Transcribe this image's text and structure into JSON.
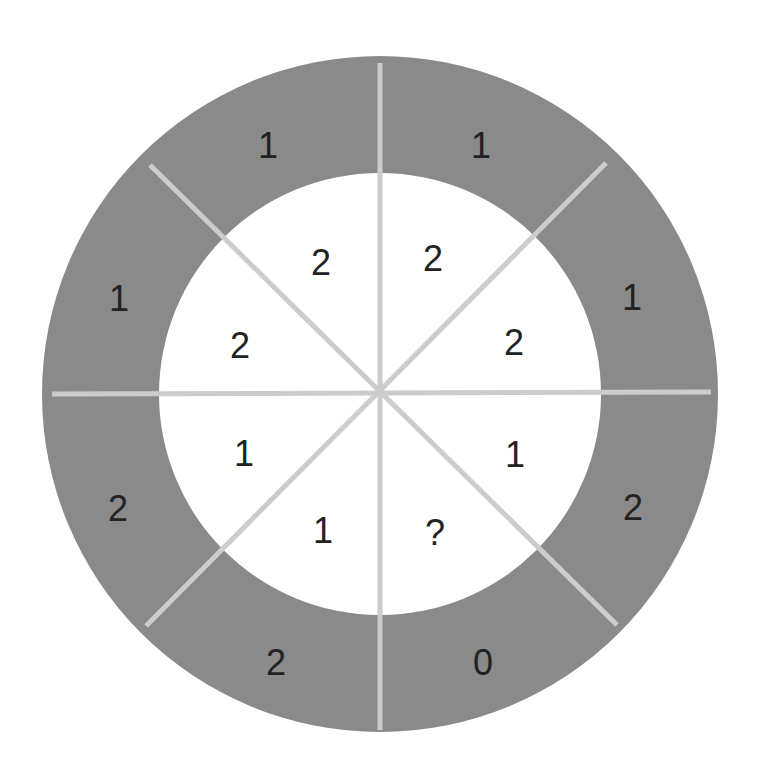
{
  "diagram": {
    "type": "circular puzzle with 8 sectors, two rings",
    "colors": {
      "background": "#ffffff",
      "outer_ring": "#8a8a8a",
      "inner_disc": "#ffffff",
      "divider_lines": "#cccccc",
      "text": "#222222"
    },
    "geometry": {
      "center": [
        380,
        394
      ],
      "outer_radius": 338,
      "inner_radius": 221,
      "divider_length": 330,
      "divider_width": 5
    },
    "outer_ring": {
      "labels": [
        {
          "sector": "top-left",
          "value": "1",
          "x": 268,
          "y": 145
        },
        {
          "sector": "top-right",
          "value": "1",
          "x": 481,
          "y": 145
        },
        {
          "sector": "right-upper",
          "value": "1",
          "x": 632,
          "y": 297
        },
        {
          "sector": "right-lower",
          "value": "2",
          "x": 633,
          "y": 507
        },
        {
          "sector": "bottom-right",
          "value": "0",
          "x": 483,
          "y": 662
        },
        {
          "sector": "bottom-left",
          "value": "2",
          "x": 276,
          "y": 662
        },
        {
          "sector": "left-lower",
          "value": "2",
          "x": 118,
          "y": 508
        },
        {
          "sector": "left-upper",
          "value": "1",
          "x": 119,
          "y": 298
        }
      ]
    },
    "inner_ring": {
      "labels": [
        {
          "sector": "top-left",
          "value": "2",
          "x": 321,
          "y": 262
        },
        {
          "sector": "top-right",
          "value": "2",
          "x": 433,
          "y": 258
        },
        {
          "sector": "right-upper",
          "value": "2",
          "x": 514,
          "y": 342
        },
        {
          "sector": "right-lower",
          "value": "1",
          "x": 515,
          "y": 454
        },
        {
          "sector": "bottom-right",
          "value": "?",
          "x": 435,
          "y": 532
        },
        {
          "sector": "bottom-left",
          "value": "1",
          "x": 323,
          "y": 530
        },
        {
          "sector": "left-lower",
          "value": "1",
          "x": 244,
          "y": 453
        },
        {
          "sector": "left-upper",
          "value": "2",
          "x": 240,
          "y": 345
        }
      ]
    },
    "dividers": [
      {
        "name": "vertical",
        "x1": 380,
        "y1": 63,
        "x2": 380,
        "y2": 730
      },
      {
        "name": "horizontal",
        "x1": 52,
        "y1": 394,
        "x2": 711,
        "y2": 392
      },
      {
        "name": "diagonal-nw-se",
        "x1": 150,
        "y1": 165,
        "x2": 617,
        "y2": 625
      },
      {
        "name": "diagonal-ne-sw",
        "x1": 606,
        "y1": 163,
        "x2": 146,
        "y2": 626
      }
    ]
  }
}
